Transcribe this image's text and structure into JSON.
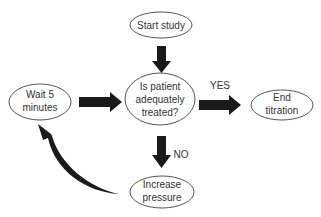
{
  "diagram": {
    "type": "flowchart",
    "nodes": {
      "start": {
        "lines": [
          "Start study"
        ]
      },
      "decision": {
        "lines": [
          "Is patient",
          "adequately",
          "treated?"
        ]
      },
      "wait": {
        "lines": [
          "Wait 5",
          "minutes"
        ]
      },
      "end": {
        "lines": [
          "End",
          "titration"
        ]
      },
      "increase": {
        "lines": [
          "Increase",
          "pressure"
        ]
      }
    },
    "edges": [
      {
        "from": "start",
        "to": "decision",
        "label": ""
      },
      {
        "from": "wait",
        "to": "decision",
        "label": ""
      },
      {
        "from": "decision",
        "to": "end",
        "label": "YES"
      },
      {
        "from": "decision",
        "to": "increase",
        "label": "NO"
      },
      {
        "from": "increase",
        "to": "wait",
        "label": ""
      }
    ],
    "labels": {
      "yes": "YES",
      "no": "NO"
    },
    "colors": {
      "arrow": "#1a1a1a",
      "ellipse_stroke": "#555555",
      "text": "#333333"
    }
  }
}
